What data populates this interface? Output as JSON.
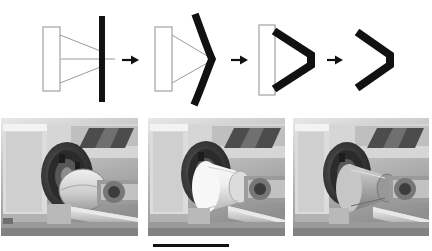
{
  "figure": {
    "background_color": "#ffffff",
    "width": 432,
    "height": 251
  },
  "schematic": {
    "caption": "Schematic of conical part forming over a mandrel",
    "outline_color": "#9a9a9a",
    "blank_color": "#111111",
    "mandrel_fill": "#ffffff",
    "arrow_color": "#111111",
    "stages": [
      {
        "index": 1,
        "name": "flat-blank",
        "label": "Flat circular blank clamped against mandrel",
        "blank_shape": "straight vertical bar",
        "mandrel_visible": true,
        "guide_lines_visible": true
      },
      {
        "index": 2,
        "name": "partially-formed",
        "label": "Blank partially bent by roller pass",
        "blank_shape": "curved bend",
        "mandrel_visible": true,
        "guide_lines_visible": true
      },
      {
        "index": 3,
        "name": "fully-formed",
        "label": "Blank fully conformed to mandrel cone",
        "blank_shape": "cone seated on mandrel",
        "mandrel_visible": true,
        "guide_lines_visible": false
      },
      {
        "index": 4,
        "name": "finished-part",
        "label": "Finished conical part removed from mandrel",
        "blank_shape": "cone",
        "mandrel_visible": false,
        "guide_lines_visible": false
      }
    ],
    "arrows": [
      {
        "index": 1,
        "label": "to partially formed"
      },
      {
        "index": 2,
        "label": "to fully formed"
      },
      {
        "index": 3,
        "label": "to finished part"
      }
    ]
  },
  "photos": {
    "caption": "Photographs of the metal spinning lathe at each stage",
    "count": 3,
    "items": [
      {
        "index": 1,
        "name": "lathe-photo-start",
        "label": "Lathe with flat blank mounted on the mandrel",
        "tone": "grayscale"
      },
      {
        "index": 2,
        "name": "lathe-photo-middle",
        "label": "Lathe with blank partly spun into a cone",
        "tone": "grayscale"
      },
      {
        "index": 3,
        "name": "lathe-photo-end",
        "label": "Lathe with fully spun conical part",
        "tone": "grayscale"
      }
    ]
  },
  "scale_bar": {
    "name": "scale-bar",
    "label": "",
    "color": "#111111"
  }
}
